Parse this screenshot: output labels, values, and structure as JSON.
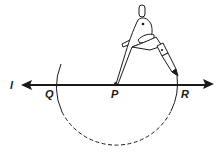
{
  "figure": {
    "colors": {
      "ink": "#1a1a1a",
      "background": "#ffffff"
    },
    "line": {
      "label": "l",
      "name": "line-l"
    },
    "points": [
      {
        "id": "Q",
        "label": "Q"
      },
      {
        "id": "P",
        "label": "P"
      },
      {
        "id": "R",
        "label": "R"
      }
    ],
    "arc": {
      "center": "P",
      "style_top": "solid",
      "style_bottom": "dashed"
    },
    "tool": {
      "name": "compass",
      "icon": "compass-icon"
    }
  }
}
